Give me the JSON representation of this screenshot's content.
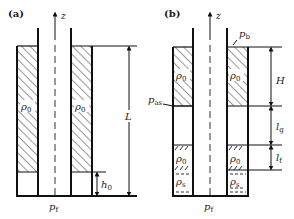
{
  "panels": [
    {
      "id": "a",
      "label": "(a)",
      "axis_label": "z",
      "density_labels": [
        "ρ",
        "ρ"
      ],
      "density_sub": "0",
      "dimension_labels": {
        "L": "L",
        "h0": "h",
        "h0_sub": "0"
      },
      "bottom_pressure": "p",
      "bottom_pressure_sub": "f"
    },
    {
      "id": "b",
      "label": "(b)",
      "axis_label": "z",
      "top_pressure": "p",
      "top_pressure_sub": "b",
      "annulus_pressure": "p",
      "annulus_pressure_sub": "as",
      "density_labels_upper": [
        "ρ",
        "ρ"
      ],
      "density_labels_mid": [
        "ρ",
        "ρ"
      ],
      "density_sub": "0",
      "sediment_labels": [
        "ρ",
        "ρ"
      ],
      "sediment_sub": "s",
      "dimension_labels": {
        "H": "H",
        "lg": "l",
        "lg_sub": "g",
        "lf": "l",
        "lf_sub": "f"
      },
      "bottom_pressure": "p",
      "bottom_pressure_sub": "f"
    }
  ],
  "colors": {
    "line": "#1a1a1a",
    "hatch": "#333333",
    "background": "#ffffff"
  }
}
